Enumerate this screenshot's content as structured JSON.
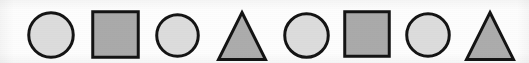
{
  "figure": {
    "name": "shape-sequence-strip",
    "width": 529,
    "height": 63,
    "background_color": "#fdfdfd",
    "pattern": "circle, square, circle, triangle, circle, square, circle, triangle",
    "shape_count": 8
  },
  "palette": {
    "stroke_color": "#141414",
    "circle_fill": "#dcdcdc",
    "square_fill": "#aaaaaa",
    "triangle_fill": "#acacac",
    "background": "#fdfdfd"
  },
  "shapes": [
    {
      "index": 1,
      "type": "circle",
      "icon": "circle-icon",
      "label": "Circle 1",
      "fill": "#dcdcdc",
      "stroke": "#141414",
      "stroke_width": 3,
      "x": 27,
      "y": 11,
      "size": 48
    },
    {
      "index": 2,
      "type": "square",
      "icon": "square-icon",
      "label": "Square 1",
      "fill": "#aaaaaa",
      "stroke": "#141414",
      "stroke_width": 3,
      "x": 91,
      "y": 10,
      "size": 49
    },
    {
      "index": 3,
      "type": "circle",
      "icon": "circle-icon",
      "label": "Circle 2",
      "fill": "#dcdcdc",
      "stroke": "#141414",
      "stroke_width": 3,
      "x": 155,
      "y": 13,
      "size": 45
    },
    {
      "index": 4,
      "type": "triangle",
      "icon": "triangle-icon",
      "label": "Triangle 1",
      "fill": "#acacac",
      "stroke": "#141414",
      "stroke_width": 3,
      "x": 217,
      "y": 11,
      "size": 50
    },
    {
      "index": 5,
      "type": "circle",
      "icon": "circle-icon",
      "label": "Circle 3",
      "fill": "#dcdcdc",
      "stroke": "#141414",
      "stroke_width": 3,
      "x": 283,
      "y": 12,
      "size": 47
    },
    {
      "index": 6,
      "type": "square",
      "icon": "square-icon",
      "label": "Square 2",
      "fill": "#aaaaaa",
      "stroke": "#141414",
      "stroke_width": 3,
      "x": 343,
      "y": 10,
      "size": 48
    },
    {
      "index": 7,
      "type": "circle",
      "icon": "circle-icon",
      "label": "Circle 4",
      "fill": "#dcdcdc",
      "stroke": "#141414",
      "stroke_width": 3,
      "x": 405,
      "y": 12,
      "size": 46
    },
    {
      "index": 8,
      "type": "triangle",
      "icon": "triangle-icon",
      "label": "Triangle 2",
      "fill": "#acacac",
      "stroke": "#141414",
      "stroke_width": 3,
      "x": 465,
      "y": 11,
      "size": 50
    }
  ]
}
